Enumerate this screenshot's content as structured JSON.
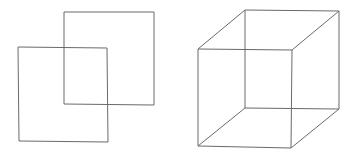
{
  "figures": [
    {
      "name": "overlapping-squares",
      "shapes": [
        {
          "name": "back-square",
          "points": "64,12 154,12 154,105 64,104"
        },
        {
          "name": "front-square",
          "points": "18,47 107,48 108,142 19,141"
        }
      ]
    },
    {
      "name": "wireframe-cube",
      "front_face": "198,49 292,50 291,148 198,146",
      "back_face": "245,10 339,11 339,109 245,108",
      "edges": [
        {
          "x1": 198,
          "y1": 49,
          "x2": 245,
          "y2": 10
        },
        {
          "x1": 292,
          "y1": 50,
          "x2": 339,
          "y2": 11
        },
        {
          "x1": 291,
          "y1": 148,
          "x2": 339,
          "y2": 109
        },
        {
          "x1": 198,
          "y1": 146,
          "x2": 245,
          "y2": 108
        }
      ]
    }
  ],
  "colors": {
    "stroke": "#6a6a6a",
    "background": "#ffffff"
  }
}
